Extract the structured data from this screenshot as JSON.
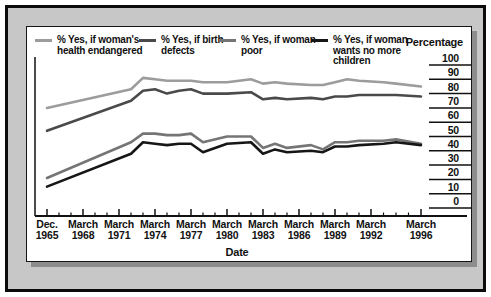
{
  "chart_data": {
    "type": "line",
    "title": "",
    "xlabel": "Date",
    "ylabel": "Percentage",
    "ylim": [
      0,
      100
    ],
    "grid": false,
    "legend_position": "top",
    "y_ticks": [
      100,
      90,
      80,
      70,
      60,
      50,
      40,
      30,
      20,
      10,
      0
    ],
    "x_tick_labels": [
      [
        "Dec.",
        "1965"
      ],
      [
        "March",
        "1968"
      ],
      [
        "March",
        "1971"
      ],
      [
        "March",
        "1974"
      ],
      [
        "March",
        "1977"
      ],
      [
        "March",
        "1980"
      ],
      [
        "March",
        "1983"
      ],
      [
        "March",
        "1986"
      ],
      [
        "March",
        "1989"
      ],
      [
        "March",
        "1992"
      ],
      [
        "March",
        "1996"
      ]
    ],
    "x_tick_years": [
      1965.92,
      1968.2,
      1971.2,
      1974.2,
      1977.2,
      1980.2,
      1983.2,
      1986.2,
      1989.2,
      1992.2,
      1996.2
    ],
    "x": [
      1965.92,
      1972.2,
      1973.2,
      1974.2,
      1975.2,
      1976.2,
      1977.2,
      1978.2,
      1980.2,
      1982.2,
      1983.2,
      1984.2,
      1985.2,
      1987.2,
      1988.2,
      1989.2,
      1990.2,
      1991.2,
      1993.2,
      1994.2,
      1996.2
    ],
    "series": [
      {
        "name": "% Yes, if woman's\nhealth endangered",
        "color": "#9c9c9c",
        "values": [
          70,
          83,
          91,
          90,
          89,
          89,
          89,
          88,
          88,
          90,
          87,
          88,
          87,
          86,
          86,
          88,
          90,
          89,
          88,
          87,
          85
        ]
      },
      {
        "name": "% Yes, if birth\ndefects",
        "color": "#4a4a4a",
        "values": [
          54,
          75,
          82,
          83,
          80,
          82,
          83,
          80,
          80,
          81,
          76,
          77,
          76,
          77,
          76,
          78,
          78,
          79,
          79,
          79,
          78
        ]
      },
      {
        "name": "% Yes, if woman\npoor",
        "color": "#757575",
        "values": [
          21,
          46,
          52,
          52,
          51,
          51,
          52,
          46,
          50,
          50,
          42,
          45,
          42,
          44,
          41,
          46,
          46,
          47,
          47,
          48,
          45
        ]
      },
      {
        "name": "% Yes, if woman\nwants no more\nchildren",
        "color": "#161616",
        "values": [
          15,
          38,
          46,
          45,
          44,
          45,
          45,
          39,
          45,
          46,
          38,
          41,
          39,
          40,
          39,
          43,
          43,
          44,
          45,
          46,
          44
        ]
      }
    ]
  },
  "colors": {
    "frame": "#0b0b0b",
    "mat": "#c7c7c7",
    "panel": "#ffffff",
    "shadow": "#8d8d8d",
    "text": "#111111"
  }
}
